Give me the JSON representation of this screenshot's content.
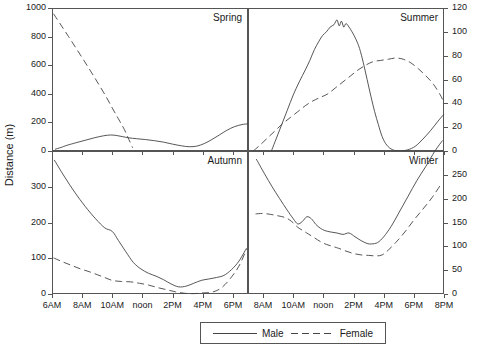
{
  "figure": {
    "ylabel": "Distance (m)",
    "panel_w": 196,
    "panel_h": 143,
    "series_colors": {
      "male": "#444444",
      "female": "#444444"
    }
  },
  "legend": {
    "position": "bottom-center",
    "items": [
      {
        "label": "Male",
        "style": "solid"
      },
      {
        "label": "Female",
        "style": "dashed"
      }
    ]
  },
  "chart_data": [
    {
      "type": "line",
      "title": "Spring",
      "xlabel": "",
      "ylabel": "Distance (m)",
      "y_axis_side": "left",
      "ylim": [
        0,
        1000
      ],
      "yticks": [
        0,
        200,
        400,
        600,
        800,
        1000
      ],
      "xlim": [
        6,
        19
      ],
      "xticks": [
        6,
        8,
        10,
        12,
        14,
        16,
        18
      ],
      "xticklabels": [
        "6AM",
        "8AM",
        "10AM",
        "noon",
        "2PM",
        "4PM",
        "6PM"
      ],
      "grid": false,
      "series": [
        {
          "name": "Male",
          "style": "solid",
          "x": [
            6.2,
            6.6,
            7.0,
            7.6,
            8.2,
            8.8,
            9.4,
            9.9,
            10.3,
            10.7,
            11.1,
            11.6,
            12.2,
            12.8,
            13.4,
            14.0,
            14.6,
            15.1,
            15.6,
            16.1,
            16.6,
            17.1,
            17.6,
            18.1,
            18.6,
            19.0
          ],
          "values": [
            12,
            25,
            40,
            58,
            75,
            92,
            106,
            112,
            108,
            100,
            92,
            86,
            80,
            72,
            62,
            48,
            36,
            30,
            34,
            52,
            80,
            112,
            145,
            170,
            185,
            190
          ]
        },
        {
          "name": "Female",
          "style": "dashed",
          "x": [
            6.1,
            6.6,
            7.1,
            7.6,
            8.1,
            8.6,
            9.1,
            9.6,
            10.0,
            10.4,
            10.8,
            11.1,
            11.35
          ],
          "values": [
            960,
            880,
            800,
            718,
            636,
            552,
            466,
            378,
            300,
            226,
            150,
            80,
            22
          ]
        }
      ]
    },
    {
      "type": "line",
      "title": "Summer",
      "xlabel": "",
      "ylabel": "",
      "y_axis_side": "right",
      "ylim": [
        0,
        120
      ],
      "yticks": [
        0,
        20,
        40,
        60,
        80,
        100,
        120
      ],
      "xlim": [
        7,
        20
      ],
      "xticks": [
        8,
        10,
        12,
        14,
        16,
        18,
        20
      ],
      "xticklabels": [
        "8AM",
        "10AM",
        "noon",
        "2PM",
        "4PM",
        "6PM",
        "8PM"
      ],
      "grid": false,
      "series": [
        {
          "name": "Male",
          "style": "solid",
          "x": [
            8.55,
            8.8,
            9.2,
            9.6,
            10.0,
            10.4,
            10.8,
            11.1,
            11.4,
            11.7,
            11.95,
            12.2,
            12.45,
            12.7,
            12.9,
            13.05,
            13.2,
            13.35,
            13.5,
            13.7,
            13.9,
            14.15,
            14.4,
            14.65,
            14.9,
            15.15,
            15.4,
            15.65,
            15.9,
            16.2,
            16.6,
            17.1,
            17.6,
            18.1,
            18.6,
            19.1,
            19.6,
            20.0
          ],
          "values": [
            0,
            8,
            21,
            34,
            47,
            58,
            68,
            76,
            85,
            92,
            97,
            100,
            104,
            106,
            110,
            105,
            109,
            104,
            107,
            104,
            100,
            94,
            86,
            74,
            60,
            46,
            33,
            22,
            12,
            5,
            1,
            0,
            1,
            4,
            10,
            17,
            25,
            31
          ]
        },
        {
          "name": "Female",
          "style": "dashed",
          "x": [
            7.35,
            7.8,
            8.3,
            8.8,
            9.3,
            9.8,
            10.3,
            10.8,
            11.3,
            11.8,
            12.3,
            12.8,
            13.3,
            13.8,
            14.3,
            14.8,
            15.3,
            15.8,
            16.3,
            16.8,
            17.3,
            17.8,
            18.3,
            18.8,
            19.3,
            19.8,
            20.0
          ],
          "values": [
            0,
            5,
            11,
            17,
            23,
            28,
            33,
            38,
            42,
            45,
            48,
            53,
            58,
            63,
            68,
            72,
            75,
            76,
            77,
            78,
            77,
            74,
            69,
            63,
            56,
            46,
            40
          ]
        }
      ]
    },
    {
      "type": "line",
      "title": "Autumn",
      "xlabel": "",
      "ylabel": "Distance (m)",
      "y_axis_side": "left",
      "ylim": [
        0,
        400
      ],
      "yticks": [
        0,
        100,
        200,
        300
      ],
      "xlim": [
        6,
        19
      ],
      "xticks": [
        6,
        8,
        10,
        12,
        14,
        16,
        18
      ],
      "xticklabels": [
        "6AM",
        "8AM",
        "10AM",
        "noon",
        "2PM",
        "4PM",
        "6PM"
      ],
      "grid": false,
      "series": [
        {
          "name": "Male",
          "style": "solid",
          "x": [
            6.15,
            6.8,
            7.5,
            8.2,
            8.9,
            9.5,
            10.0,
            10.4,
            10.9,
            11.4,
            11.9,
            12.4,
            12.9,
            13.4,
            13.9,
            14.4,
            14.9,
            15.4,
            15.9,
            16.4,
            16.9,
            17.4,
            17.9,
            18.4,
            18.9
          ],
          "values": [
            375,
            330,
            285,
            245,
            210,
            185,
            175,
            150,
            118,
            88,
            70,
            58,
            50,
            40,
            28,
            20,
            22,
            30,
            38,
            42,
            46,
            52,
            68,
            92,
            128
          ]
        },
        {
          "name": "Female",
          "style": "dashed",
          "x": [
            6.1,
            6.7,
            7.3,
            7.9,
            8.5,
            9.0,
            9.5,
            10.0,
            10.6,
            11.2,
            11.8,
            12.4,
            13.0,
            13.6,
            14.2,
            14.8,
            15.4,
            16.0,
            16.6,
            17.2,
            17.8,
            18.4,
            18.9
          ],
          "values": [
            101,
            90,
            80,
            70,
            62,
            54,
            46,
            38,
            35,
            34,
            30,
            25,
            18,
            12,
            6,
            2,
            1,
            3,
            5,
            16,
            42,
            78,
            125
          ]
        }
      ]
    },
    {
      "type": "line",
      "title": "Winter",
      "xlabel": "",
      "ylabel": "",
      "y_axis_side": "right",
      "ylim": [
        0,
        300
      ],
      "yticks": [
        0,
        50,
        100,
        150,
        200,
        250
      ],
      "xlim": [
        7,
        20
      ],
      "xticks": [
        8,
        10,
        12,
        14,
        16,
        18,
        20
      ],
      "xticklabels": [
        "8AM",
        "10AM",
        "noon",
        "2PM",
        "4PM",
        "6PM",
        "8PM"
      ],
      "grid": false,
      "series": [
        {
          "name": "Male",
          "style": "solid",
          "x": [
            7.55,
            8.1,
            8.6,
            9.1,
            9.6,
            10.0,
            10.3,
            10.6,
            10.9,
            11.2,
            11.5,
            11.8,
            12.1,
            12.5,
            12.9,
            13.3,
            13.7,
            14.1,
            14.5,
            14.9,
            15.2,
            15.6,
            16.0,
            16.5,
            17.0,
            17.6,
            18.2,
            18.8,
            19.4,
            19.9
          ],
          "values": [
            283,
            252,
            225,
            200,
            176,
            158,
            147,
            152,
            162,
            158,
            146,
            138,
            133,
            130,
            128,
            125,
            128,
            120,
            112,
            106,
            105,
            108,
            120,
            142,
            170,
            204,
            238,
            268,
            300,
            322
          ]
        },
        {
          "name": "Female",
          "style": "dashed",
          "x": [
            7.5,
            8.0,
            8.5,
            9.0,
            9.5,
            9.9,
            10.3,
            10.7,
            11.0,
            11.4,
            11.8,
            12.2,
            12.6,
            13.0,
            13.5,
            14.0,
            14.5,
            15.0,
            15.5,
            15.9,
            16.3,
            16.8,
            17.4,
            18.0,
            18.6,
            19.2,
            19.8
          ],
          "values": [
            168,
            169,
            167,
            164,
            160,
            152,
            140,
            132,
            126,
            118,
            110,
            104,
            100,
            96,
            90,
            85,
            82,
            81,
            80,
            82,
            92,
            108,
            130,
            155,
            178,
            202,
            230
          ]
        }
      ]
    }
  ]
}
